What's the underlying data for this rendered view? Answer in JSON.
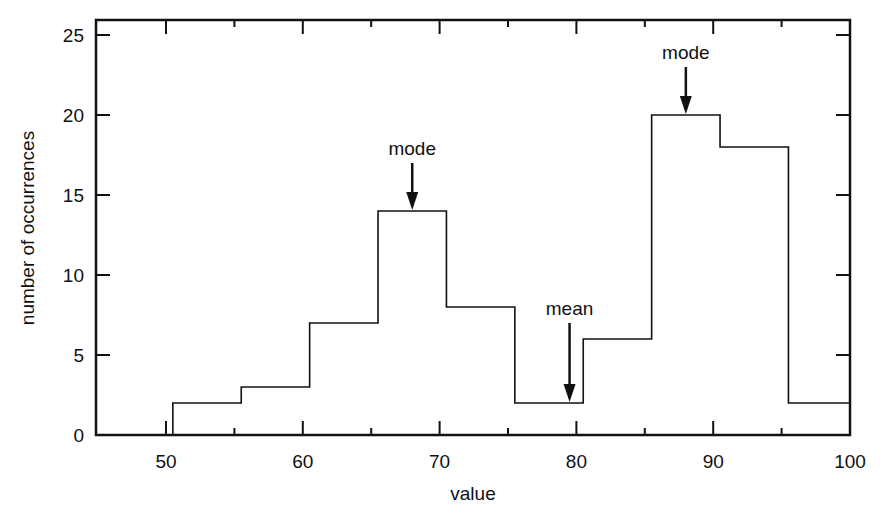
{
  "chart_data": {
    "type": "bar",
    "subtype": "histogram",
    "title": "",
    "xlabel": "value",
    "ylabel": "number of occurrences",
    "xlim": [
      45,
      100
    ],
    "ylim": [
      0,
      26
    ],
    "x_ticks_major": [
      50,
      60,
      70,
      80,
      90,
      100
    ],
    "x_ticks_minor": [
      55,
      65,
      75,
      85,
      95
    ],
    "y_ticks": [
      0,
      5,
      10,
      15,
      20,
      25
    ],
    "grid": false,
    "legend": null,
    "bin_edges": [
      50.5,
      55.5,
      60.5,
      65.5,
      70.5,
      75.5,
      80.5,
      85.5,
      90.5,
      95.5,
      100
    ],
    "categories": [
      "50-55",
      "55-60",
      "60-65",
      "65-70",
      "70-75",
      "75-80",
      "80-85",
      "85-90",
      "90-95",
      "95-100"
    ],
    "values": [
      2,
      3,
      7,
      14,
      8,
      2,
      6,
      20,
      18,
      2
    ],
    "annotations": [
      {
        "label": "mode",
        "x": 68,
        "y_tip": 14,
        "y_label": 17.5
      },
      {
        "label": "mean",
        "x": 79.5,
        "y_tip": 2,
        "y_label": 7.5
      },
      {
        "label": "mode",
        "x": 88,
        "y_tip": 20,
        "y_label": 23.5
      }
    ]
  }
}
